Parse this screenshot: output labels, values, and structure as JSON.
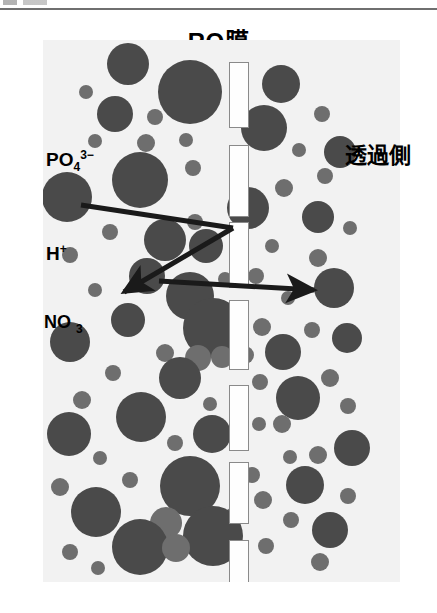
{
  "figure": {
    "title": "RO膜",
    "title_icon": "membrane-label",
    "permeate_label": "透過側",
    "scan_artifact": "",
    "colors": {
      "field_background": "#f2f2f2",
      "particle_dark": "#4a4a4a",
      "particle_mid": "#6e6e6e",
      "pore_fill": "#fefefe",
      "pore_stroke": "#8a8a8a",
      "arrow": "#1a1a1a",
      "text": "#000000"
    },
    "labels": [
      {
        "name": "phosphate-ion",
        "base": "PO",
        "sub": "4",
        "sup": "3−"
      },
      {
        "name": "hydrogen-ion",
        "base": "H",
        "sub": "",
        "sup": "+"
      },
      {
        "name": "nitrate-ion",
        "base": "NO",
        "sub": "3",
        "sup": ""
      }
    ],
    "arrows": [
      {
        "name": "rejected-ion-arrow",
        "description": "incident path from PO4 to membrane then reflected down-left",
        "head": "down-left"
      },
      {
        "name": "permeating-ion-arrow",
        "description": "horizontal path crossing the membrane to permeate side",
        "head": "right"
      }
    ],
    "pores": [
      {
        "x": 229,
        "y": 62,
        "w": 20,
        "h": 66
      },
      {
        "x": 229,
        "y": 145,
        "w": 20,
        "h": 72
      },
      {
        "x": 229,
        "y": 222,
        "w": 20,
        "h": 66
      },
      {
        "x": 229,
        "y": 300,
        "w": 20,
        "h": 70
      },
      {
        "x": 229,
        "y": 385,
        "w": 20,
        "h": 66
      },
      {
        "x": 229,
        "y": 462,
        "w": 20,
        "h": 62
      },
      {
        "x": 229,
        "y": 540,
        "w": 20,
        "h": 73
      }
    ],
    "particles": [
      {
        "x": 128,
        "y": 64,
        "r": 21,
        "t": "dark"
      },
      {
        "x": 190,
        "y": 92,
        "r": 32,
        "t": "dark"
      },
      {
        "x": 281,
        "y": 84,
        "r": 19,
        "t": "dark"
      },
      {
        "x": 86,
        "y": 92,
        "r": 7,
        "t": "mid"
      },
      {
        "x": 322,
        "y": 114,
        "r": 8,
        "t": "mid"
      },
      {
        "x": 115,
        "y": 114,
        "r": 18,
        "t": "dark"
      },
      {
        "x": 155,
        "y": 117,
        "r": 8,
        "t": "mid"
      },
      {
        "x": 264,
        "y": 128,
        "r": 23,
        "t": "dark"
      },
      {
        "x": 95,
        "y": 141,
        "r": 7,
        "t": "mid"
      },
      {
        "x": 340,
        "y": 152,
        "r": 16,
        "t": "dark"
      },
      {
        "x": 146,
        "y": 143,
        "r": 9,
        "t": "mid"
      },
      {
        "x": 186,
        "y": 140,
        "r": 7,
        "t": "mid"
      },
      {
        "x": 299,
        "y": 150,
        "r": 7,
        "t": "mid"
      },
      {
        "x": 140,
        "y": 180,
        "r": 28,
        "t": "dark"
      },
      {
        "x": 67,
        "y": 197,
        "r": 25,
        "t": "dark"
      },
      {
        "x": 193,
        "y": 168,
        "r": 8,
        "t": "mid"
      },
      {
        "x": 325,
        "y": 176,
        "r": 8,
        "t": "mid"
      },
      {
        "x": 284,
        "y": 188,
        "r": 9,
        "t": "mid"
      },
      {
        "x": 248,
        "y": 208,
        "r": 21,
        "t": "dark"
      },
      {
        "x": 318,
        "y": 217,
        "r": 16,
        "t": "dark"
      },
      {
        "x": 195,
        "y": 222,
        "r": 8,
        "t": "mid"
      },
      {
        "x": 110,
        "y": 232,
        "r": 8,
        "t": "mid"
      },
      {
        "x": 350,
        "y": 228,
        "r": 7,
        "t": "mid"
      },
      {
        "x": 165,
        "y": 240,
        "r": 21,
        "t": "dark"
      },
      {
        "x": 206,
        "y": 246,
        "r": 17,
        "t": "dark"
      },
      {
        "x": 272,
        "y": 246,
        "r": 7,
        "t": "mid"
      },
      {
        "x": 70,
        "y": 255,
        "r": 8,
        "t": "mid"
      },
      {
        "x": 318,
        "y": 258,
        "r": 9,
        "t": "mid"
      },
      {
        "x": 147,
        "y": 276,
        "r": 18,
        "t": "dark"
      },
      {
        "x": 225,
        "y": 279,
        "r": 7,
        "t": "mid"
      },
      {
        "x": 256,
        "y": 276,
        "r": 8,
        "t": "mid"
      },
      {
        "x": 334,
        "y": 288,
        "r": 20,
        "t": "dark"
      },
      {
        "x": 95,
        "y": 290,
        "r": 7,
        "t": "mid"
      },
      {
        "x": 190,
        "y": 296,
        "r": 24,
        "t": "dark"
      },
      {
        "x": 288,
        "y": 298,
        "r": 7,
        "t": "mid"
      },
      {
        "x": 128,
        "y": 320,
        "r": 17,
        "t": "dark"
      },
      {
        "x": 213,
        "y": 328,
        "r": 30,
        "t": "dark"
      },
      {
        "x": 262,
        "y": 327,
        "r": 9,
        "t": "mid"
      },
      {
        "x": 312,
        "y": 330,
        "r": 8,
        "t": "mid"
      },
      {
        "x": 70,
        "y": 342,
        "r": 20,
        "t": "dark"
      },
      {
        "x": 347,
        "y": 338,
        "r": 15,
        "t": "dark"
      },
      {
        "x": 165,
        "y": 353,
        "r": 9,
        "t": "mid"
      },
      {
        "x": 283,
        "y": 352,
        "r": 18,
        "t": "dark"
      },
      {
        "x": 198,
        "y": 358,
        "r": 13,
        "t": "mid"
      },
      {
        "x": 222,
        "y": 357,
        "r": 11,
        "t": "mid"
      },
      {
        "x": 245,
        "y": 355,
        "r": 9,
        "t": "mid"
      },
      {
        "x": 113,
        "y": 373,
        "r": 8,
        "t": "mid"
      },
      {
        "x": 180,
        "y": 378,
        "r": 21,
        "t": "dark"
      },
      {
        "x": 260,
        "y": 382,
        "r": 8,
        "t": "mid"
      },
      {
        "x": 330,
        "y": 378,
        "r": 9,
        "t": "mid"
      },
      {
        "x": 298,
        "y": 398,
        "r": 22,
        "t": "dark"
      },
      {
        "x": 82,
        "y": 400,
        "r": 9,
        "t": "mid"
      },
      {
        "x": 210,
        "y": 404,
        "r": 7,
        "t": "mid"
      },
      {
        "x": 348,
        "y": 406,
        "r": 8,
        "t": "mid"
      },
      {
        "x": 141,
        "y": 417,
        "r": 25,
        "t": "dark"
      },
      {
        "x": 259,
        "y": 424,
        "r": 7,
        "t": "mid"
      },
      {
        "x": 282,
        "y": 424,
        "r": 9,
        "t": "mid"
      },
      {
        "x": 69,
        "y": 434,
        "r": 22,
        "t": "dark"
      },
      {
        "x": 212,
        "y": 434,
        "r": 19,
        "t": "dark"
      },
      {
        "x": 175,
        "y": 443,
        "r": 8,
        "t": "mid"
      },
      {
        "x": 318,
        "y": 455,
        "r": 9,
        "t": "mid"
      },
      {
        "x": 352,
        "y": 448,
        "r": 18,
        "t": "dark"
      },
      {
        "x": 100,
        "y": 458,
        "r": 7,
        "t": "mid"
      },
      {
        "x": 290,
        "y": 457,
        "r": 7,
        "t": "mid"
      },
      {
        "x": 190,
        "y": 486,
        "r": 30,
        "t": "dark"
      },
      {
        "x": 252,
        "y": 475,
        "r": 8,
        "t": "mid"
      },
      {
        "x": 305,
        "y": 485,
        "r": 19,
        "t": "dark"
      },
      {
        "x": 60,
        "y": 487,
        "r": 9,
        "t": "mid"
      },
      {
        "x": 130,
        "y": 480,
        "r": 8,
        "t": "mid"
      },
      {
        "x": 348,
        "y": 496,
        "r": 8,
        "t": "mid"
      },
      {
        "x": 263,
        "y": 500,
        "r": 9,
        "t": "mid"
      },
      {
        "x": 96,
        "y": 512,
        "r": 25,
        "t": "dark"
      },
      {
        "x": 232,
        "y": 515,
        "r": 7,
        "t": "mid"
      },
      {
        "x": 291,
        "y": 520,
        "r": 8,
        "t": "mid"
      },
      {
        "x": 166,
        "y": 523,
        "r": 16,
        "t": "mid"
      },
      {
        "x": 213,
        "y": 536,
        "r": 30,
        "t": "dark"
      },
      {
        "x": 330,
        "y": 530,
        "r": 18,
        "t": "dark"
      },
      {
        "x": 140,
        "y": 547,
        "r": 28,
        "t": "dark"
      },
      {
        "x": 266,
        "y": 546,
        "r": 8,
        "t": "mid"
      },
      {
        "x": 70,
        "y": 552,
        "r": 8,
        "t": "mid"
      },
      {
        "x": 176,
        "y": 548,
        "r": 14,
        "t": "mid"
      },
      {
        "x": 320,
        "y": 562,
        "r": 9,
        "t": "mid"
      },
      {
        "x": 98,
        "y": 568,
        "r": 7,
        "t": "mid"
      }
    ]
  }
}
